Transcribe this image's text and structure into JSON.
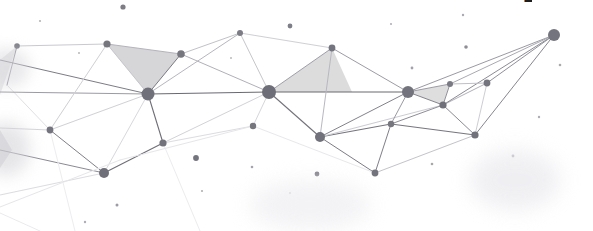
{
  "canvas": {
    "width": 593,
    "height": 231,
    "background": "#ffffff",
    "title": "Low poly network mesh banner"
  },
  "palette": {
    "node_dark": "#6b6b73",
    "node_mid": "#7c7c85",
    "node_light": "#9a9aa2",
    "edge_dark": "#6f6f77",
    "edge_mid": "#9b9ba3",
    "edge_light": "#c9c9d0",
    "edge_faint": "#e2e2e7",
    "triangle_fill": "#dcdcdc",
    "triangle_fill_soft": "#e4e4e6",
    "smudge": "#d8d8dc",
    "glyph": "#1d1d1f"
  },
  "glyph": {
    "text": "P",
    "left": 523,
    "top": -10,
    "width": 9,
    "height": 12,
    "font_size": 22,
    "color": "#1d1d1f"
  },
  "triangles": [
    {
      "name": "triangle-left-large",
      "points": "107,44 181,54 148,94",
      "fill": "#d6d6d8",
      "opacity": 1
    },
    {
      "name": "triangle-center",
      "points": "269,92 332,48 352,92",
      "fill": "#dcdcdc",
      "opacity": 1
    },
    {
      "name": "triangle-right-small",
      "points": "408,92 450,84 443,105",
      "fill": "#dedede",
      "opacity": 1
    },
    {
      "name": "triangle-edge-left",
      "points": "0,60 17,46 0,95",
      "fill": "#e8e8ea",
      "opacity": 1
    },
    {
      "name": "triangle-edge-lower-left",
      "points": "0,130 12,150 0,168",
      "fill": "#e0e0e3",
      "opacity": 1
    }
  ],
  "edges": [
    {
      "name": "edge-l1",
      "x1": 17,
      "y1": 46,
      "x2": 107,
      "y2": 44,
      "color": "#c9c9d0",
      "width": 1
    },
    {
      "name": "edge-l2",
      "x1": 17,
      "y1": 46,
      "x2": 7,
      "y2": 85,
      "color": "#8f8f98",
      "width": 1
    },
    {
      "name": "edge-l3",
      "x1": 7,
      "y1": 85,
      "x2": 50,
      "y2": 130,
      "color": "#e0e0e4",
      "width": 1
    },
    {
      "name": "edge-l4",
      "x1": 0,
      "y1": 92,
      "x2": 148,
      "y2": 94,
      "color": "#9b9ba3",
      "width": 1
    },
    {
      "name": "edge-l5",
      "x1": 0,
      "y1": 60,
      "x2": 148,
      "y2": 94,
      "color": "#7c7c85",
      "width": 1
    },
    {
      "name": "edge-l6",
      "x1": 107,
      "y1": 44,
      "x2": 148,
      "y2": 94,
      "color": "#c5c5cb",
      "width": 1
    },
    {
      "name": "edge-l7",
      "x1": 107,
      "y1": 44,
      "x2": 181,
      "y2": 54,
      "color": "#b4b4bc",
      "width": 1
    },
    {
      "name": "edge-l8",
      "x1": 107,
      "y1": 44,
      "x2": 50,
      "y2": 130,
      "color": "#cfcfd5",
      "width": 1
    },
    {
      "name": "edge-l9",
      "x1": 50,
      "y1": 130,
      "x2": 104,
      "y2": 173,
      "color": "#7f7f88",
      "width": 1
    },
    {
      "name": "edge-l10",
      "x1": 50,
      "y1": 130,
      "x2": 148,
      "y2": 94,
      "color": "#d0d0d6",
      "width": 1
    },
    {
      "name": "edge-l11",
      "x1": 0,
      "y1": 150,
      "x2": 104,
      "y2": 173,
      "color": "#8a8a93",
      "width": 1
    },
    {
      "name": "edge-l12",
      "x1": 0,
      "y1": 128,
      "x2": 50,
      "y2": 130,
      "color": "#d4d4da",
      "width": 1
    },
    {
      "name": "edge-l13",
      "x1": 104,
      "y1": 173,
      "x2": 163,
      "y2": 143,
      "color": "#6f6f77",
      "width": 1.1
    },
    {
      "name": "edge-l14",
      "x1": 104,
      "y1": 173,
      "x2": 148,
      "y2": 94,
      "color": "#d8d8dd",
      "width": 1
    },
    {
      "name": "edge-l15",
      "x1": 0,
      "y1": 195,
      "x2": 104,
      "y2": 173,
      "color": "#dcdce1",
      "width": 1
    },
    {
      "name": "edge-c1",
      "x1": 148,
      "y1": 94,
      "x2": 181,
      "y2": 54,
      "color": "#7a7a83",
      "width": 1
    },
    {
      "name": "edge-c2",
      "x1": 148,
      "y1": 94,
      "x2": 163,
      "y2": 143,
      "color": "#6f6f77",
      "width": 1.1
    },
    {
      "name": "edge-c3",
      "x1": 148,
      "y1": 94,
      "x2": 269,
      "y2": 92,
      "color": "#6a6a72",
      "width": 1.2
    },
    {
      "name": "edge-c4",
      "x1": 148,
      "y1": 94,
      "x2": 240,
      "y2": 33,
      "color": "#b6b6be",
      "width": 1
    },
    {
      "name": "edge-c5",
      "x1": 181,
      "y1": 54,
      "x2": 240,
      "y2": 33,
      "color": "#c1c1c8",
      "width": 1
    },
    {
      "name": "edge-c6",
      "x1": 181,
      "y1": 54,
      "x2": 269,
      "y2": 92,
      "color": "#b0b0b8",
      "width": 1
    },
    {
      "name": "edge-c7",
      "x1": 240,
      "y1": 33,
      "x2": 269,
      "y2": 92,
      "color": "#c6c6cc",
      "width": 1
    },
    {
      "name": "edge-c8",
      "x1": 240,
      "y1": 33,
      "x2": 332,
      "y2": 48,
      "color": "#cfcfd5",
      "width": 1
    },
    {
      "name": "edge-c9",
      "x1": 163,
      "y1": 143,
      "x2": 269,
      "y2": 92,
      "color": "#d2d2d8",
      "width": 1
    },
    {
      "name": "edge-c10",
      "x1": 163,
      "y1": 143,
      "x2": 253,
      "y2": 126,
      "color": "#dcdce1",
      "width": 1
    },
    {
      "name": "edge-c11",
      "x1": 253,
      "y1": 126,
      "x2": 269,
      "y2": 92,
      "color": "#d6d6dc",
      "width": 1
    },
    {
      "name": "edge-c12",
      "x1": 269,
      "y1": 92,
      "x2": 332,
      "y2": 48,
      "color": "#9f9fa8",
      "width": 1
    },
    {
      "name": "edge-c13",
      "x1": 269,
      "y1": 92,
      "x2": 320,
      "y2": 137,
      "color": "#74747c",
      "width": 1.1
    },
    {
      "name": "edge-c14",
      "x1": 269,
      "y1": 92,
      "x2": 408,
      "y2": 92,
      "color": "#6a6a72",
      "width": 1.2
    },
    {
      "name": "edge-c15",
      "x1": 332,
      "y1": 48,
      "x2": 320,
      "y2": 137,
      "color": "#b8b8c0",
      "width": 1
    },
    {
      "name": "edge-c16",
      "x1": 332,
      "y1": 48,
      "x2": 408,
      "y2": 92,
      "color": "#9c9ca5",
      "width": 1
    },
    {
      "name": "edge-c17",
      "x1": 320,
      "y1": 137,
      "x2": 391,
      "y2": 124,
      "color": "#75757d",
      "width": 1.1
    },
    {
      "name": "edge-c18",
      "x1": 320,
      "y1": 137,
      "x2": 375,
      "y2": 173,
      "color": "#7c7c85",
      "width": 1
    },
    {
      "name": "edge-c19",
      "x1": 320,
      "y1": 137,
      "x2": 408,
      "y2": 92,
      "color": "#82828b",
      "width": 1
    },
    {
      "name": "edge-c20",
      "x1": 320,
      "y1": 137,
      "x2": 443,
      "y2": 105,
      "color": "#cbcbd2",
      "width": 1
    },
    {
      "name": "edge-r1",
      "x1": 391,
      "y1": 124,
      "x2": 408,
      "y2": 92,
      "color": "#9a9aa3",
      "width": 1
    },
    {
      "name": "edge-r2",
      "x1": 391,
      "y1": 124,
      "x2": 375,
      "y2": 173,
      "color": "#7f7f88",
      "width": 1
    },
    {
      "name": "edge-r3",
      "x1": 391,
      "y1": 124,
      "x2": 443,
      "y2": 105,
      "color": "#8d8d96",
      "width": 1
    },
    {
      "name": "edge-r4",
      "x1": 391,
      "y1": 124,
      "x2": 475,
      "y2": 135,
      "color": "#76767e",
      "width": 1.1
    },
    {
      "name": "edge-r5",
      "x1": 375,
      "y1": 173,
      "x2": 475,
      "y2": 135,
      "color": "#c3c3ca",
      "width": 1
    },
    {
      "name": "edge-r6",
      "x1": 408,
      "y1": 92,
      "x2": 443,
      "y2": 105,
      "color": "#85858e",
      "width": 1
    },
    {
      "name": "edge-r7",
      "x1": 408,
      "y1": 92,
      "x2": 450,
      "y2": 84,
      "color": "#9d9da6",
      "width": 1
    },
    {
      "name": "edge-r8",
      "x1": 408,
      "y1": 92,
      "x2": 554,
      "y2": 35,
      "color": "#9a9aa3",
      "width": 1
    },
    {
      "name": "edge-r9",
      "x1": 443,
      "y1": 105,
      "x2": 450,
      "y2": 84,
      "color": "#92929b",
      "width": 1
    },
    {
      "name": "edge-r10",
      "x1": 443,
      "y1": 105,
      "x2": 487,
      "y2": 83,
      "color": "#b0b0b8",
      "width": 1
    },
    {
      "name": "edge-r11",
      "x1": 443,
      "y1": 105,
      "x2": 475,
      "y2": 135,
      "color": "#8a8a93",
      "width": 1
    },
    {
      "name": "edge-r12",
      "x1": 443,
      "y1": 105,
      "x2": 554,
      "y2": 35,
      "color": "#8b8b94",
      "width": 1
    },
    {
      "name": "edge-r13",
      "x1": 450,
      "y1": 84,
      "x2": 487,
      "y2": 83,
      "color": "#c0c0c7",
      "width": 1
    },
    {
      "name": "edge-r14",
      "x1": 487,
      "y1": 83,
      "x2": 475,
      "y2": 135,
      "color": "#cecdd4",
      "width": 1
    },
    {
      "name": "edge-r15",
      "x1": 487,
      "y1": 83,
      "x2": 554,
      "y2": 35,
      "color": "#90909a",
      "width": 1
    },
    {
      "name": "edge-r16",
      "x1": 475,
      "y1": 135,
      "x2": 554,
      "y2": 35,
      "color": "#86868f",
      "width": 1
    },
    {
      "name": "edge-r17",
      "x1": 450,
      "y1": 84,
      "x2": 554,
      "y2": 35,
      "color": "#aaaab2",
      "width": 1
    },
    {
      "name": "edge-f1",
      "x1": 0,
      "y1": 207,
      "x2": 120,
      "y2": 160,
      "color": "#e6e6ea",
      "width": 1
    },
    {
      "name": "edge-f2",
      "x1": 120,
      "y1": 160,
      "x2": 253,
      "y2": 126,
      "color": "#e6e6ea",
      "width": 1
    },
    {
      "name": "edge-f3",
      "x1": 253,
      "y1": 126,
      "x2": 375,
      "y2": 173,
      "color": "#e8e8ec",
      "width": 1
    },
    {
      "name": "edge-f4",
      "x1": 0,
      "y1": 213,
      "x2": 40,
      "y2": 231,
      "color": "#eaeaee",
      "width": 1
    },
    {
      "name": "edge-f5",
      "x1": 163,
      "y1": 143,
      "x2": 200,
      "y2": 231,
      "color": "#ececef",
      "width": 1
    },
    {
      "name": "edge-f6",
      "x1": 50,
      "y1": 130,
      "x2": 75,
      "y2": 231,
      "color": "#ededf0",
      "width": 1
    }
  ],
  "nodes": [
    {
      "name": "node-hub-left",
      "cx": 148,
      "cy": 94,
      "r": 6.5,
      "color": "#70707a"
    },
    {
      "name": "node-hub-center",
      "cx": 269,
      "cy": 92,
      "r": 7.0,
      "color": "#6e6e78"
    },
    {
      "name": "node-hub-right",
      "cx": 408,
      "cy": 92,
      "r": 6.0,
      "color": "#73737d"
    },
    {
      "name": "node-hub-far-right",
      "cx": 554,
      "cy": 35,
      "r": 6.0,
      "color": "#74747e"
    },
    {
      "name": "node-hub-lower-left",
      "cx": 104,
      "cy": 173,
      "r": 5.0,
      "color": "#6f6f79"
    },
    {
      "name": "node-mid-lower-center",
      "cx": 320,
      "cy": 137,
      "r": 5.0,
      "color": "#71717b"
    },
    {
      "name": "node-upper-left",
      "cx": 107,
      "cy": 44,
      "r": 3.6,
      "color": "#76767f"
    },
    {
      "name": "node-upper-mid",
      "cx": 181,
      "cy": 54,
      "r": 3.8,
      "color": "#76767f"
    },
    {
      "name": "node-top-center",
      "cx": 240,
      "cy": 33,
      "r": 3.0,
      "color": "#7c7c85"
    },
    {
      "name": "node-top-right",
      "cx": 332,
      "cy": 48,
      "r": 3.4,
      "color": "#74747e"
    },
    {
      "name": "node-left-edge",
      "cx": 17,
      "cy": 46,
      "r": 2.8,
      "color": "#7c7c85"
    },
    {
      "name": "node-left-mid",
      "cx": 50,
      "cy": 130,
      "r": 3.4,
      "color": "#74747e"
    },
    {
      "name": "node-center-low",
      "cx": 163,
      "cy": 143,
      "r": 3.6,
      "color": "#73737d"
    },
    {
      "name": "node-center-lower",
      "cx": 253,
      "cy": 126,
      "r": 3.2,
      "color": "#76767f"
    },
    {
      "name": "node-right-upper",
      "cx": 450,
      "cy": 84,
      "r": 3.0,
      "color": "#7a7a84"
    },
    {
      "name": "node-right-inner",
      "cx": 443,
      "cy": 105,
      "r": 3.6,
      "color": "#71717b"
    },
    {
      "name": "node-right-outer",
      "cx": 487,
      "cy": 83,
      "r": 3.4,
      "color": "#74747e"
    },
    {
      "name": "node-right-low",
      "cx": 475,
      "cy": 135,
      "r": 3.6,
      "color": "#71717b"
    },
    {
      "name": "node-right-left-low",
      "cx": 391,
      "cy": 124,
      "r": 3.2,
      "color": "#76767f"
    },
    {
      "name": "node-bottom-center",
      "cx": 375,
      "cy": 173,
      "r": 3.4,
      "color": "#73737d"
    }
  ],
  "loose_dots": [
    {
      "name": "dot-top-left",
      "cx": 123,
      "cy": 7,
      "r": 2.6,
      "color": "#7d7d86"
    },
    {
      "name": "dot-top-right",
      "cx": 290,
      "cy": 26,
      "r": 2.4,
      "color": "#7e7e88"
    },
    {
      "name": "dot-upper-right",
      "cx": 466,
      "cy": 47,
      "r": 1.8,
      "color": "#8e8e97"
    },
    {
      "name": "dot-mid-right",
      "cx": 463,
      "cy": 15,
      "r": 1.2,
      "color": "#a9a9b1"
    },
    {
      "name": "dot-right-far",
      "cx": 560,
      "cy": 65,
      "r": 1.3,
      "color": "#a9a9b1"
    },
    {
      "name": "dot-mid-center",
      "cx": 412,
      "cy": 68,
      "r": 1.4,
      "color": "#a2a2ab"
    },
    {
      "name": "dot-mid-low",
      "cx": 196,
      "cy": 158,
      "r": 2.9,
      "color": "#74747e"
    },
    {
      "name": "dot-low-center",
      "cx": 252,
      "cy": 167,
      "r": 1.3,
      "color": "#a4a4ad"
    },
    {
      "name": "dot-low-right",
      "cx": 317,
      "cy": 174,
      "r": 2.4,
      "color": "#7c7c86"
    },
    {
      "name": "dot-low-left",
      "cx": 202,
      "cy": 191,
      "r": 1.1,
      "color": "#b0b0b7"
    },
    {
      "name": "dot-bottom-left",
      "cx": 117,
      "cy": 205,
      "r": 1.5,
      "color": "#9c9ca5"
    },
    {
      "name": "dot-bottom-mid",
      "cx": 85,
      "cy": 222,
      "r": 1.2,
      "color": "#aeaeb6"
    },
    {
      "name": "dot-bottom-right",
      "cx": 432,
      "cy": 164,
      "r": 1.3,
      "color": "#a6a6af"
    },
    {
      "name": "dot-right-bottom",
      "cx": 513,
      "cy": 156,
      "r": 1.4,
      "color": "#a3a3ac"
    },
    {
      "name": "dot-far-bottom",
      "cx": 539,
      "cy": 117,
      "r": 1.2,
      "color": "#adadb5"
    },
    {
      "name": "dot-left-upper",
      "cx": 40,
      "cy": 21,
      "r": 1.1,
      "color": "#b4b4bb"
    },
    {
      "name": "dot-left-dot",
      "cx": 79,
      "cy": 53,
      "r": 1.0,
      "color": "#b6b6bd"
    },
    {
      "name": "dot-center-tiny",
      "cx": 231,
      "cy": 58,
      "r": 1.0,
      "color": "#b8b8bf"
    },
    {
      "name": "dot-upper-faint",
      "cx": 391,
      "cy": 24,
      "r": 1.1,
      "color": "#b2b2b9"
    },
    {
      "name": "dot-low-faint",
      "cx": 290,
      "cy": 193,
      "r": 1.0,
      "color": "#bcbcc2"
    }
  ],
  "smudges": [
    {
      "name": "smudge-left-upper",
      "left": -16,
      "top": 48,
      "width": 46,
      "height": 40,
      "color": "#d9d9de",
      "opacity": 0.55,
      "blur": 7
    },
    {
      "name": "smudge-left-lower",
      "left": -18,
      "top": 122,
      "width": 48,
      "height": 54,
      "color": "#d5d5da",
      "opacity": 0.6,
      "blur": 8
    },
    {
      "name": "smudge-right-low",
      "left": 470,
      "top": 150,
      "width": 90,
      "height": 60,
      "color": "#ececf0",
      "opacity": 0.8,
      "blur": 10
    },
    {
      "name": "smudge-center-low",
      "left": 250,
      "top": 180,
      "width": 120,
      "height": 50,
      "color": "#f0f0f3",
      "opacity": 0.8,
      "blur": 10
    }
  ]
}
